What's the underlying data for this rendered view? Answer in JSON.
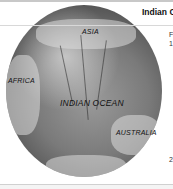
{
  "header": {
    "title": "Indian O"
  },
  "side_text": {
    "line1": "F",
    "line2": "1",
    "line3": "2"
  },
  "map": {
    "labels": {
      "asia": "ASIA",
      "africa": "AFRICA",
      "ocean": "INDIAN OCEAN",
      "australia": "AUSTRALIA"
    }
  }
}
